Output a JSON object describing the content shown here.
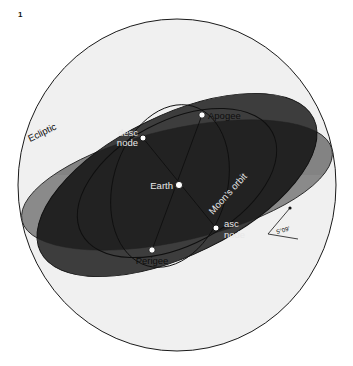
{
  "figure": {
    "number": "1",
    "caption_present": false
  },
  "diagram": {
    "type": "celestial-sphere-lunar-orbit",
    "colors": {
      "background": "#ffffff",
      "sphere_light": "#f0f0f0",
      "ecliptic_band": "#8a8a8a",
      "ecliptic_band_far": "#7c7c7c",
      "orbit_plane_dark": "#2b2b2b",
      "orbit_plane_overlap": "#242424",
      "outline": "#1a1a1a",
      "marker_fill": "#ffffff",
      "marker_stroke": "#111111",
      "label_dark": "#0d0d0d",
      "label_light": "#e8e8e8"
    },
    "labels": {
      "ecliptic": "Ecliptic",
      "moons_orbit": "Moon's orbit",
      "earth": "Earth",
      "apogee": "Apogee",
      "perigee": "Perigee",
      "desc_node_line1": "desc",
      "desc_node_line2": "node",
      "asc_node_line1": "asc",
      "asc_node_line2": "node",
      "inclination": "5°09'"
    },
    "points": [
      {
        "name": "earth",
        "label": "Earth",
        "x": 176,
        "y": 185
      },
      {
        "name": "apogee",
        "label": "Apogee",
        "x": 202,
        "y": 115
      },
      {
        "name": "perigee",
        "label": "Perigee",
        "x": 152,
        "y": 250
      },
      {
        "name": "desc-node",
        "label": "desc node",
        "x": 143,
        "y": 138
      },
      {
        "name": "asc-node",
        "label": "asc node",
        "x": 216,
        "y": 228
      }
    ],
    "annotations": {
      "inclination_value": "5°09'",
      "inclination_meaning": "angle between Moon's orbital plane and the ecliptic"
    }
  }
}
